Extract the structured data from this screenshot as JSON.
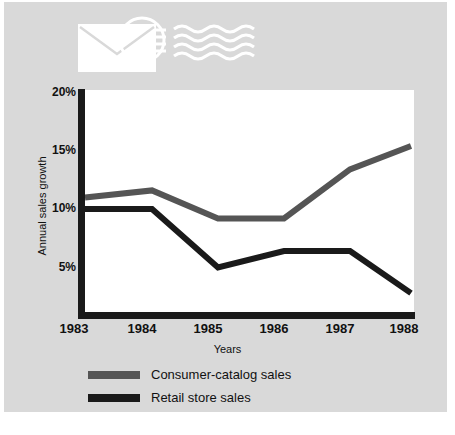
{
  "figure": {
    "background_color": "#d9d9d9",
    "panel_color": "#ffffff",
    "caption": ""
  },
  "decoration": {
    "logo_icon": "envelope-with-speed-lines-icon",
    "logo_color": "#ffffff"
  },
  "axes": {
    "y_title": "Annual sales growth",
    "x_title": "Years",
    "y_ticks": [
      "20%",
      "15%",
      "10%",
      "5%"
    ],
    "x_ticks": [
      "1983",
      "1984",
      "1985",
      "1986",
      "1987",
      "1988"
    ]
  },
  "legend": {
    "items": [
      {
        "label": "Consumer-catalog sales",
        "color": "#555555"
      },
      {
        "label": "Retail store sales",
        "color": "#1a1a1a"
      }
    ]
  },
  "chart_data": {
    "type": "line",
    "title": "",
    "xlabel": "Years",
    "ylabel": "Annual sales growth",
    "x": [
      1983,
      1984,
      1985,
      1986,
      1987,
      1988
    ],
    "categories": [
      "1983",
      "1984",
      "1985",
      "1986",
      "1987",
      "1988"
    ],
    "ylim": [
      0,
      20
    ],
    "xlim": [
      1983,
      1988
    ],
    "ytick_values": [
      20,
      15,
      10,
      5
    ],
    "ytick_labels": [
      "20%",
      "15%",
      "10%",
      "5%"
    ],
    "y_unit": "percent",
    "grid": false,
    "legend_position": "below-plot-left",
    "series": [
      {
        "name": "Consumer-catalog sales",
        "color": "#555555",
        "line_width": 6,
        "values": [
          11.0,
          11.6,
          9.2,
          9.2,
          13.4,
          15.4
        ]
      },
      {
        "name": "Retail store sales",
        "color": "#1a1a1a",
        "line_width": 6,
        "values": [
          10.0,
          10.0,
          5.0,
          6.4,
          6.4,
          2.8
        ]
      }
    ]
  }
}
